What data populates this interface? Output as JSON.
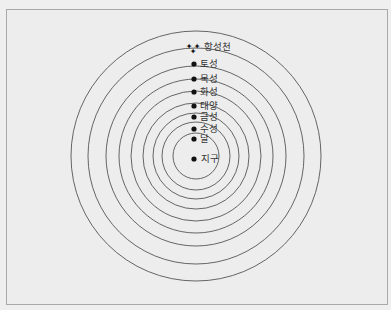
{
  "diagram": {
    "title": "",
    "center": {
      "x": 196,
      "y": 156
    },
    "circle_radii": [
      125,
      108,
      90,
      77,
      65,
      53,
      43,
      34,
      23
    ],
    "colors": {
      "stroke": "#555555",
      "dot": "#111111",
      "text": "#333333",
      "background": "#efefef",
      "frame": "#a9a9a9"
    },
    "bodies": [
      {
        "label": "항성천",
        "icon": "stars-icon",
        "y": 47
      },
      {
        "label": "토성",
        "icon": "dot",
        "y": 64
      },
      {
        "label": "목성",
        "icon": "dot",
        "y": 79
      },
      {
        "label": "화성",
        "icon": "dot",
        "y": 92
      },
      {
        "label": "태양",
        "icon": "dot",
        "y": 106
      },
      {
        "label": "금성",
        "icon": "dot",
        "y": 117
      },
      {
        "label": "수성",
        "icon": "dot",
        "y": 129
      },
      {
        "label": "달",
        "icon": "dot",
        "y": 139
      },
      {
        "label": "지구",
        "icon": "dot",
        "y": 159
      }
    ]
  }
}
